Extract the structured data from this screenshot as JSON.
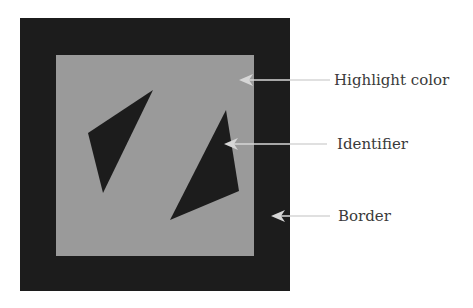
{
  "figure": {
    "outer_square": {
      "x": 20,
      "y": 18,
      "width": 270,
      "height": 273,
      "color": "#1c1c1c"
    },
    "inner_square": {
      "x": 56,
      "y": 55,
      "width": 198,
      "height": 201,
      "color": "#9a9a9a"
    },
    "shapes": [
      {
        "name": "left-triangle",
        "points": "153,90 88,133 103,193",
        "color": "#1c1c1c"
      },
      {
        "name": "right-triangle",
        "points": "226,110 239,191 170,220",
        "color": "#1c1c1c"
      }
    ]
  },
  "annotations": [
    {
      "label": "Highlight color",
      "arrow_tip": [
        239,
        80
      ],
      "line_end": [
        330,
        80
      ],
      "text_pos": [
        334,
        85
      ]
    },
    {
      "label": "Identifier",
      "arrow_tip": [
        224,
        144
      ],
      "line_end": [
        327,
        144
      ],
      "text_pos": [
        337,
        149
      ]
    },
    {
      "label": "Border",
      "arrow_tip": [
        271,
        216
      ],
      "line_end": [
        330,
        216
      ],
      "text_pos": [
        338,
        221
      ]
    }
  ],
  "colors": {
    "arrow": "#d6d6d6",
    "text": "#3a3a3a"
  }
}
